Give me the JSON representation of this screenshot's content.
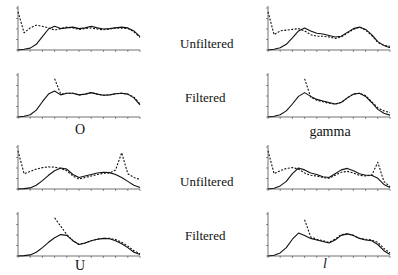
{
  "figure": {
    "row_labels": [
      "Unfiltered",
      "Filtered",
      "Unfiltered",
      "Filtered"
    ],
    "captions": {
      "top_left": "O",
      "top_right": "gamma",
      "bottom_left": "U",
      "bottom_right": "l"
    }
  },
  "chart_data": [
    {
      "id": "O-unfiltered",
      "type": "line",
      "title": "",
      "xlabel": "",
      "ylabel": "",
      "x": [
        0,
        1,
        2,
        3,
        4,
        5,
        6,
        7,
        8,
        9,
        10,
        11,
        12,
        13,
        14,
        15,
        16,
        17,
        18,
        19,
        20
      ],
      "series": [
        {
          "name": "solid",
          "style": "solid",
          "values": [
            0.0,
            0.02,
            0.05,
            0.15,
            0.35,
            0.55,
            0.62,
            0.56,
            0.58,
            0.6,
            0.56,
            0.58,
            0.62,
            0.58,
            0.55,
            0.56,
            0.58,
            0.6,
            0.58,
            0.5,
            0.35
          ]
        },
        {
          "name": "dashed",
          "style": "dashed",
          "values": [
            1.0,
            0.45,
            0.58,
            0.65,
            0.62,
            0.58,
            0.52,
            0.56,
            0.6,
            0.58,
            0.54,
            0.56,
            0.58,
            0.55,
            0.53,
            0.55,
            0.58,
            0.57,
            0.56,
            0.48,
            0.33
          ]
        }
      ],
      "ylim": [
        0,
        1.1
      ],
      "grid": false
    },
    {
      "id": "O-filtered",
      "type": "line",
      "x": [
        0,
        1,
        2,
        3,
        4,
        5,
        6,
        7,
        8,
        9,
        10,
        11,
        12,
        13,
        14,
        15,
        16,
        17,
        18,
        19,
        20
      ],
      "series": [
        {
          "name": "solid",
          "style": "solid",
          "values": [
            0.0,
            0.02,
            0.06,
            0.18,
            0.4,
            0.6,
            0.68,
            0.58,
            0.62,
            0.62,
            0.58,
            0.6,
            0.64,
            0.6,
            0.57,
            0.58,
            0.61,
            0.62,
            0.6,
            0.5,
            0.32
          ]
        },
        {
          "name": "dashed",
          "style": "dashed",
          "values": [
            null,
            null,
            null,
            null,
            null,
            null,
            1.0,
            0.6,
            0.62,
            0.62,
            0.58,
            0.6,
            0.64,
            0.6,
            0.57,
            0.58,
            0.61,
            0.62,
            0.6,
            0.52,
            0.34
          ]
        }
      ],
      "ylim": [
        0,
        1.1
      ],
      "grid": false
    },
    {
      "id": "U-unfiltered",
      "type": "line",
      "x": [
        0,
        1,
        2,
        3,
        4,
        5,
        6,
        7,
        8,
        9,
        10,
        11,
        12,
        13,
        14,
        15,
        16,
        17,
        18,
        19,
        20
      ],
      "series": [
        {
          "name": "solid",
          "style": "solid",
          "values": [
            0.0,
            0.01,
            0.03,
            0.1,
            0.22,
            0.36,
            0.48,
            0.55,
            0.52,
            0.38,
            0.3,
            0.34,
            0.38,
            0.42,
            0.44,
            0.43,
            0.38,
            0.3,
            0.2,
            0.1,
            0.04
          ]
        },
        {
          "name": "dashed",
          "style": "dashed",
          "values": [
            1.0,
            0.4,
            0.46,
            0.52,
            0.56,
            0.58,
            0.57,
            0.54,
            0.48,
            0.34,
            0.26,
            0.3,
            0.34,
            0.38,
            0.41,
            0.42,
            0.5,
            0.95,
            0.4,
            0.3,
            0.25
          ]
        }
      ],
      "ylim": [
        0,
        1.1
      ],
      "grid": false
    },
    {
      "id": "U-filtered",
      "type": "line",
      "x": [
        0,
        1,
        2,
        3,
        4,
        5,
        6,
        7,
        8,
        9,
        10,
        11,
        12,
        13,
        14,
        15,
        16,
        17,
        18,
        19,
        20
      ],
      "series": [
        {
          "name": "solid",
          "style": "solid",
          "values": [
            0.0,
            0.01,
            0.03,
            0.1,
            0.22,
            0.36,
            0.48,
            0.56,
            0.54,
            0.4,
            0.3,
            0.34,
            0.4,
            0.44,
            0.46,
            0.45,
            0.4,
            0.32,
            0.22,
            0.1,
            0.04
          ]
        },
        {
          "name": "dashed",
          "style": "dashed",
          "values": [
            null,
            null,
            null,
            null,
            null,
            null,
            1.0,
            0.78,
            0.56,
            0.4,
            0.3,
            0.34,
            0.4,
            0.44,
            0.46,
            0.46,
            0.43,
            0.36,
            0.26,
            0.14,
            0.06
          ]
        }
      ],
      "ylim": [
        0,
        1.1
      ],
      "grid": false
    },
    {
      "id": "gamma-unfiltered",
      "type": "line",
      "x": [
        0,
        1,
        2,
        3,
        4,
        5,
        6,
        7,
        8,
        9,
        10,
        11,
        12,
        13,
        14,
        15,
        16,
        17,
        18,
        19,
        20
      ],
      "series": [
        {
          "name": "solid",
          "style": "solid",
          "values": [
            0.0,
            0.02,
            0.06,
            0.15,
            0.32,
            0.5,
            0.58,
            0.5,
            0.44,
            0.42,
            0.38,
            0.34,
            0.36,
            0.46,
            0.56,
            0.6,
            0.54,
            0.4,
            0.22,
            0.12,
            0.06
          ]
        },
        {
          "name": "dashed",
          "style": "dashed",
          "values": [
            1.0,
            0.4,
            0.5,
            0.52,
            0.54,
            0.56,
            0.5,
            0.4,
            0.36,
            0.36,
            0.34,
            0.3,
            0.34,
            0.44,
            0.54,
            0.6,
            0.52,
            0.38,
            0.2,
            0.12,
            0.1
          ]
        }
      ],
      "ylim": [
        0,
        1.1
      ],
      "grid": false
    },
    {
      "id": "gamma-filtered",
      "type": "line",
      "x": [
        0,
        1,
        2,
        3,
        4,
        5,
        6,
        7,
        8,
        9,
        10,
        11,
        12,
        13,
        14,
        15,
        16,
        17,
        18,
        19,
        20
      ],
      "series": [
        {
          "name": "solid",
          "style": "solid",
          "values": [
            0.0,
            0.02,
            0.06,
            0.16,
            0.34,
            0.54,
            0.64,
            0.54,
            0.46,
            0.42,
            0.38,
            0.34,
            0.38,
            0.5,
            0.6,
            0.62,
            0.54,
            0.38,
            0.2,
            0.1,
            0.05
          ]
        },
        {
          "name": "dashed",
          "style": "dashed",
          "values": [
            null,
            null,
            null,
            null,
            null,
            null,
            1.0,
            0.52,
            0.44,
            0.4,
            0.36,
            0.34,
            0.38,
            0.5,
            0.6,
            0.62,
            0.56,
            0.4,
            0.24,
            0.16,
            0.12
          ]
        }
      ],
      "ylim": [
        0,
        1.1
      ],
      "grid": false
    },
    {
      "id": "l-unfiltered",
      "type": "line",
      "x": [
        0,
        1,
        2,
        3,
        4,
        5,
        6,
        7,
        8,
        9,
        10,
        11,
        12,
        13,
        14,
        15,
        16,
        17,
        18,
        19,
        20
      ],
      "series": [
        {
          "name": "solid",
          "style": "solid",
          "values": [
            0.0,
            0.02,
            0.08,
            0.2,
            0.4,
            0.55,
            0.5,
            0.42,
            0.38,
            0.32,
            0.3,
            0.4,
            0.5,
            0.54,
            0.48,
            0.4,
            0.36,
            0.36,
            0.28,
            0.12,
            0.04
          ]
        },
        {
          "name": "dashed",
          "style": "dashed",
          "values": [
            1.0,
            0.4,
            0.48,
            0.54,
            0.56,
            0.52,
            0.42,
            0.36,
            0.34,
            0.3,
            0.28,
            0.36,
            0.44,
            0.46,
            0.42,
            0.36,
            0.34,
            0.36,
            0.7,
            0.2,
            0.06
          ]
        }
      ],
      "ylim": [
        0,
        1.1
      ],
      "grid": false
    },
    {
      "id": "l-filtered",
      "type": "line",
      "x": [
        0,
        1,
        2,
        3,
        4,
        5,
        6,
        7,
        8,
        9,
        10,
        11,
        12,
        13,
        14,
        15,
        16,
        17,
        18,
        19,
        20
      ],
      "series": [
        {
          "name": "solid",
          "style": "solid",
          "values": [
            0.0,
            0.02,
            0.08,
            0.22,
            0.44,
            0.6,
            0.54,
            0.46,
            0.42,
            0.38,
            0.34,
            0.42,
            0.54,
            0.58,
            0.54,
            0.46,
            0.42,
            0.4,
            0.3,
            0.14,
            0.04
          ]
        },
        {
          "name": "dashed",
          "style": "dashed",
          "values": [
            null,
            null,
            null,
            null,
            null,
            null,
            0.95,
            0.5,
            0.44,
            0.4,
            0.36,
            0.44,
            0.56,
            0.58,
            0.54,
            0.46,
            0.44,
            0.42,
            0.36,
            0.2,
            0.08
          ]
        }
      ],
      "ylim": [
        0,
        1.1
      ],
      "grid": false
    }
  ]
}
